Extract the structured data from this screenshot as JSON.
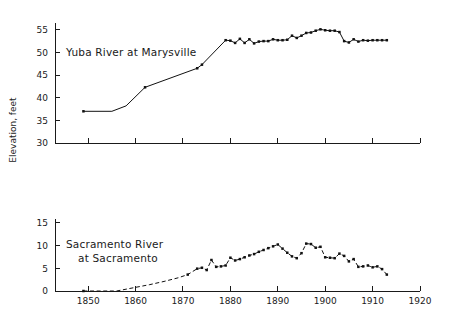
{
  "figure": {
    "background": "#ffffff",
    "ink_color": "#111111",
    "y_axis_title": "Elevation, feet"
  },
  "chart_data": [
    {
      "type": "line",
      "title": "Yuba River at Marysville",
      "xlabel": "",
      "ylabel": "Elevation, feet",
      "xlim": [
        1843,
        1920
      ],
      "ylim": [
        30,
        56.5
      ],
      "xticks": [
        1850,
        1860,
        1870,
        1880,
        1890,
        1900,
        1910,
        1920
      ],
      "yticks": [
        30,
        35,
        40,
        45,
        50,
        55
      ],
      "ytick_labels": [
        "30",
        "35",
        "40",
        "45",
        "50",
        "55"
      ],
      "grid": false,
      "legend": "none",
      "line_style": "solid",
      "markers": true,
      "x": [
        1849,
        1855,
        1858,
        1862,
        1873,
        1874,
        1879,
        1880,
        1881,
        1882,
        1883,
        1884,
        1885,
        1886,
        1887,
        1888,
        1889,
        1890,
        1891,
        1892,
        1893,
        1894,
        1895,
        1896,
        1897,
        1898,
        1899,
        1900,
        1901,
        1902,
        1903,
        1904,
        1905,
        1906,
        1907,
        1908,
        1909,
        1910,
        1911,
        1912,
        1913
      ],
      "y": [
        37.0,
        37.0,
        38.2,
        42.3,
        46.5,
        47.3,
        52.7,
        52.6,
        52.1,
        53.0,
        52.1,
        52.9,
        52.0,
        52.4,
        52.5,
        52.5,
        52.9,
        52.7,
        52.7,
        52.8,
        53.7,
        53.2,
        53.7,
        54.3,
        54.4,
        54.8,
        55.1,
        54.9,
        54.8,
        54.8,
        54.5,
        52.5,
        52.2,
        52.9,
        52.4,
        52.7,
        52.6,
        52.7,
        52.7,
        52.7,
        52.7
      ]
    },
    {
      "type": "line",
      "title": "Sacramento River\nat Sacramento",
      "title_line1": "Sacramento River",
      "title_line2": "at Sacramento",
      "xlabel": "",
      "ylabel": "Elevation, feet",
      "xlim": [
        1843,
        1920
      ],
      "ylim": [
        0,
        15.8
      ],
      "xticks": [
        1850,
        1860,
        1870,
        1880,
        1890,
        1900,
        1910,
        1920
      ],
      "xtick_labels": [
        "1850",
        "1860",
        "1870",
        "1880",
        "1890",
        "1900",
        "1910",
        "1920"
      ],
      "yticks": [
        0,
        5,
        10,
        15
      ],
      "ytick_labels": [
        "0",
        "5",
        "10",
        "15"
      ],
      "grid": false,
      "legend": "none",
      "line_style": "dashed",
      "markers": true,
      "x": [
        1849,
        1856,
        1860,
        1863,
        1866,
        1869,
        1871,
        1873,
        1874,
        1875,
        1876,
        1877,
        1878,
        1879,
        1880,
        1881,
        1882,
        1883,
        1884,
        1885,
        1886,
        1887,
        1888,
        1889,
        1890,
        1891,
        1892,
        1893,
        1894,
        1895,
        1896,
        1897,
        1898,
        1899,
        1900,
        1901,
        1902,
        1903,
        1904,
        1905,
        1906,
        1907,
        1908,
        1909,
        1910,
        1911,
        1912,
        1913
      ],
      "y": [
        0.0,
        0.0,
        0.8,
        1.4,
        2.1,
        2.9,
        3.6,
        4.9,
        5.1,
        4.6,
        6.8,
        5.3,
        5.4,
        5.6,
        7.3,
        6.7,
        7.0,
        7.4,
        7.8,
        8.1,
        8.6,
        9.0,
        9.4,
        9.8,
        10.2,
        9.3,
        8.4,
        7.6,
        7.2,
        8.3,
        10.4,
        10.3,
        9.5,
        9.7,
        7.4,
        7.3,
        7.2,
        8.2,
        7.7,
        6.5,
        7.0,
        5.3,
        5.4,
        5.6,
        5.2,
        5.4,
        4.8,
        3.6
      ]
    }
  ]
}
